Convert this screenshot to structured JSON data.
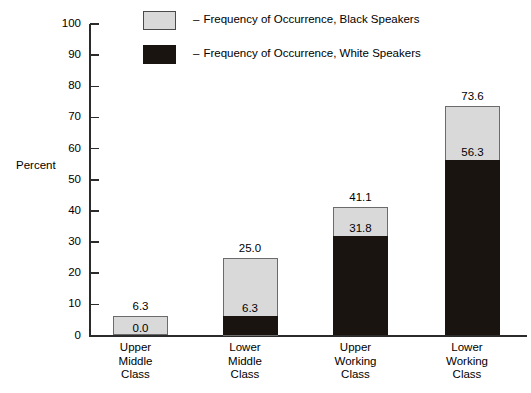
{
  "chart_data": {
    "type": "bar",
    "title": "",
    "subtitle": "",
    "xlabel": "",
    "ylabel": "Percent",
    "ylim": [
      0,
      100
    ],
    "ytick_step": 10,
    "yticks": [
      "100",
      "90",
      "80",
      "70",
      "60",
      "50",
      "40",
      "30",
      "20",
      "10",
      "0"
    ],
    "grid": false,
    "stacked": true,
    "legend_position": "top",
    "categories": [
      "Upper\nMiddle\nClass",
      "Lower\nMiddle\nClass",
      "Upper\nWorking\nClass",
      "Lower\nWorking\nClass"
    ],
    "series": [
      {
        "name": "Frequency of Occurrence, Black Speakers",
        "color": "#d9d9d9",
        "values": [
          6.3,
          25.0,
          41.1,
          73.6
        ],
        "note": "values are cumulative totals shown at top of each bar"
      },
      {
        "name": "Frequency of Occurrence, White Speakers",
        "color": "#1a1410",
        "values": [
          0.0,
          6.3,
          31.8,
          56.3
        ],
        "note": "values are the dark lower segment of each bar"
      }
    ],
    "bars": [
      {
        "category_lines": [
          "Upper",
          "Middle",
          "Class"
        ],
        "total": 6.3,
        "total_label": "6.3",
        "black_speaker_value": 0.0,
        "white_speaker_label": "0.0"
      },
      {
        "category_lines": [
          "Lower",
          "Middle",
          "Class"
        ],
        "total": 25.0,
        "total_label": "25.0",
        "black_speaker_value": 6.3,
        "white_speaker_label": "6.3"
      },
      {
        "category_lines": [
          "Upper",
          "Working",
          "Class"
        ],
        "total": 41.1,
        "total_label": "41.1",
        "black_speaker_value": 31.8,
        "white_speaker_label": "31.8"
      },
      {
        "category_lines": [
          "Lower",
          "Working",
          "Class"
        ],
        "total": 73.6,
        "total_label": "73.6",
        "black_speaker_value": 56.3,
        "white_speaker_label": "56.3"
      }
    ]
  },
  "legend": {
    "dash": "–",
    "items": [
      {
        "label": "Frequency of Occurrence, Black Speakers",
        "swatch": "gray"
      },
      {
        "label": "Frequency of Occurrence, White Speakers",
        "swatch": "black"
      }
    ]
  },
  "axis": {
    "y_title": "Percent",
    "ticks": [
      "100",
      "90",
      "80",
      "70",
      "60",
      "50",
      "40",
      "30",
      "20",
      "10",
      "0"
    ]
  },
  "colors": {
    "light_gray_fill": "#d9d9d9",
    "black_fill": "#1a1410",
    "axis": "#2b2b2b",
    "background": "#ffffff"
  }
}
